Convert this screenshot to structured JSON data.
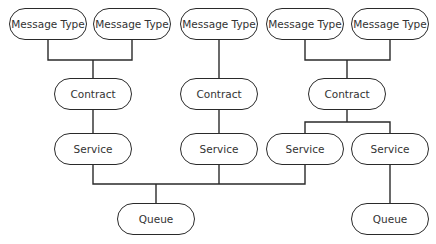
{
  "diagram": {
    "message_types": [
      {
        "label": "Message Type",
        "cx": 48
      },
      {
        "label": "Message Type",
        "cx": 132
      },
      {
        "label": "Message Type",
        "cx": 219
      },
      {
        "label": "Message Type",
        "cx": 305
      },
      {
        "label": "Message Type",
        "cx": 390
      }
    ],
    "contracts": [
      {
        "label": "Contract",
        "cx": 93
      },
      {
        "label": "Contract",
        "cx": 219
      },
      {
        "label": "Contract",
        "cx": 347
      }
    ],
    "services": [
      {
        "label": "Service",
        "cx": 93
      },
      {
        "label": "Service",
        "cx": 219
      },
      {
        "label": "Service",
        "cx": 305
      },
      {
        "label": "Service",
        "cx": 390
      }
    ],
    "queues": [
      {
        "label": "Queue",
        "cx": 156
      },
      {
        "label": "Queue",
        "cx": 390
      }
    ],
    "line_color": "#2a2a2a"
  }
}
